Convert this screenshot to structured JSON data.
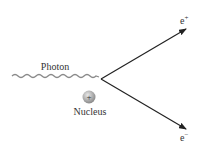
{
  "diagram": {
    "labels": {
      "photon": "Photon",
      "nucleus": "Nucleus",
      "nucleus_charge": "+",
      "positron": "e",
      "positron_sup": "+",
      "electron": "e",
      "electron_sup": "−"
    },
    "colors": {
      "wave": "#888888",
      "arrow": "#222222",
      "nucleus_fill": "#b0b0b0",
      "text": "#333333"
    }
  }
}
